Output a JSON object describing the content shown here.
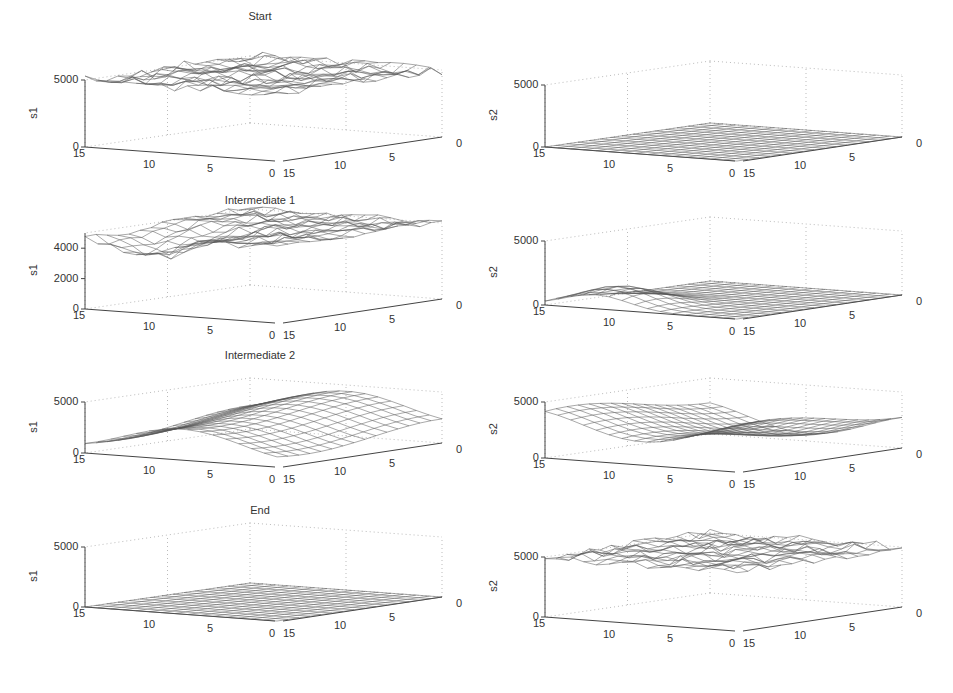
{
  "figure": {
    "background": "#ffffff",
    "line_color": "#555555"
  },
  "chart_data": [
    {
      "type": "surface",
      "panel": "row1-left",
      "title": "Start",
      "zlabel": "s1",
      "zticks": [
        "0",
        "5000"
      ],
      "xticks": [
        "15",
        "10",
        "5",
        "0"
      ],
      "yticks": [
        "15",
        "10",
        "5",
        "0"
      ],
      "xlim": [
        0,
        15
      ],
      "ylim": [
        0,
        15
      ],
      "zlim": [
        0,
        5000
      ],
      "surface": {
        "shape": "flat-noisy",
        "level": 5000,
        "noise": 350
      },
      "grid": true
    },
    {
      "type": "surface",
      "panel": "row1-right",
      "title": "",
      "zlabel": "s2",
      "zticks": [
        "0",
        "5000"
      ],
      "xticks": [
        "15",
        "10",
        "5",
        "0"
      ],
      "yticks": [
        "15",
        "10",
        "5",
        "0"
      ],
      "xlim": [
        0,
        15
      ],
      "ylim": [
        0,
        15
      ],
      "zlim": [
        0,
        5000
      ],
      "surface": {
        "shape": "flat",
        "level": 0,
        "noise": 0
      },
      "grid": true
    },
    {
      "type": "surface",
      "panel": "row2-left",
      "title": "Intermediate 1",
      "zlabel": "s1",
      "zticks": [
        "0",
        "2000",
        "4000"
      ],
      "xticks": [
        "15",
        "10",
        "5",
        "0"
      ],
      "yticks": [
        "15",
        "10",
        "5",
        "0"
      ],
      "xlim": [
        0,
        15
      ],
      "ylim": [
        0,
        15
      ],
      "zlim": [
        0,
        5000
      ],
      "surface": {
        "shape": "dip",
        "level": 5000,
        "dip_depth": 1500,
        "dip_center": [
          11,
          13
        ],
        "dip_width": 2.5,
        "noise": 250
      },
      "grid": true
    },
    {
      "type": "surface",
      "panel": "row2-right",
      "title": "",
      "zlabel": "s2",
      "zticks": [
        "0",
        "5000"
      ],
      "xticks": [
        "15",
        "10",
        "5",
        "0"
      ],
      "yticks": [
        "15",
        "10",
        "5",
        "0"
      ],
      "xlim": [
        0,
        15
      ],
      "ylim": [
        0,
        15
      ],
      "zlim": [
        0,
        5000
      ],
      "surface": {
        "shape": "bump",
        "level": 0,
        "bump_height": 1500,
        "bump_center": [
          11,
          13
        ],
        "bump_width": 2.5,
        "noise": 0
      },
      "grid": true
    },
    {
      "type": "surface",
      "panel": "row3-left",
      "title": "Intermediate 2",
      "zlabel": "s1",
      "zticks": [
        "0",
        "5000"
      ],
      "xticks": [
        "15",
        "10",
        "5",
        "0"
      ],
      "yticks": [
        "15",
        "10",
        "5",
        "0"
      ],
      "xlim": [
        0,
        15
      ],
      "ylim": [
        0,
        15
      ],
      "zlim": [
        0,
        5000
      ],
      "surface": {
        "shape": "wave",
        "level": 2500,
        "amplitude": 1900,
        "phase": 0,
        "noise": 0
      },
      "grid": true
    },
    {
      "type": "surface",
      "panel": "row3-right",
      "title": "",
      "zlabel": "s2",
      "zticks": [
        "0",
        "5000"
      ],
      "xticks": [
        "15",
        "10",
        "5",
        "0"
      ],
      "yticks": [
        "15",
        "10",
        "5",
        "0"
      ],
      "xlim": [
        0,
        15
      ],
      "ylim": [
        0,
        15
      ],
      "zlim": [
        0,
        5000
      ],
      "surface": {
        "shape": "wave",
        "level": 2600,
        "amplitude": -1900,
        "phase": 0,
        "noise": 0
      },
      "grid": true
    },
    {
      "type": "surface",
      "panel": "row4-left",
      "title": "End",
      "zlabel": "s1",
      "zticks": [
        "0",
        "5000"
      ],
      "xticks": [
        "15",
        "10",
        "5",
        "0"
      ],
      "yticks": [
        "15",
        "10",
        "5",
        "0"
      ],
      "xlim": [
        0,
        15
      ],
      "ylim": [
        0,
        15
      ],
      "zlim": [
        0,
        5000
      ],
      "surface": {
        "shape": "flat",
        "level": 0,
        "noise": 0
      },
      "grid": true
    },
    {
      "type": "surface",
      "panel": "row4-right",
      "title": "",
      "zlabel": "s2",
      "zticks": [
        "0",
        "5000"
      ],
      "xticks": [
        "15",
        "10",
        "5",
        "0"
      ],
      "yticks": [
        "15",
        "10",
        "5",
        "0"
      ],
      "xlim": [
        0,
        15
      ],
      "ylim": [
        0,
        15
      ],
      "zlim": [
        0,
        5000
      ],
      "surface": {
        "shape": "flat-noisy",
        "level": 5000,
        "noise": 350
      },
      "grid": true
    }
  ],
  "layout": {
    "panels": [
      {
        "ox": 85,
        "base": 147,
        "zh": 67,
        "title_y": 10
      },
      {
        "ox": 545,
        "base": 147,
        "zh": 62,
        "title_y": 10
      },
      {
        "ox": 85,
        "base": 309,
        "zh": 76,
        "title_y": 194
      },
      {
        "ox": 545,
        "base": 305,
        "zh": 64,
        "title_y": 194
      },
      {
        "ox": 85,
        "base": 453,
        "zh": 51,
        "title_y": 349
      },
      {
        "ox": 545,
        "base": 458,
        "zh": 56,
        "title_y": 349
      },
      {
        "ox": 85,
        "base": 607,
        "zh": 60,
        "title_y": 504
      },
      {
        "ox": 545,
        "base": 617,
        "zh": 60,
        "title_y": 504
      }
    ]
  }
}
